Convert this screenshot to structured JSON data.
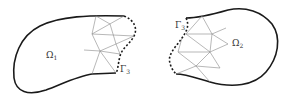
{
  "diagram": {
    "left_domain": {
      "label": "Ω",
      "sub": "1"
    },
    "right_domain": {
      "label": "Ω",
      "sub": "2"
    },
    "left_interface": {
      "label": "Γ",
      "sub": "3"
    },
    "right_interface": {
      "label": "Γ",
      "sub": "3"
    },
    "colors": {
      "boundary": "#1a1a1a",
      "mesh": "#888888",
      "interface": "#1a1a1a"
    }
  }
}
